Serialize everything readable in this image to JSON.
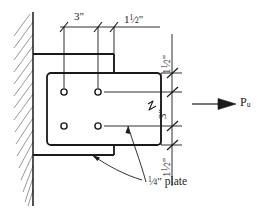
{
  "diagram": {
    "type": "structural-detail",
    "stroke_color": "#1a1a1a",
    "background": "#ffffff",
    "width": 264,
    "height": 212
  },
  "dimensions": {
    "top": [
      {
        "id": "top-dim-1",
        "value": "3\"",
        "whole": "3",
        "unit": "\"",
        "orientation": "horizontal"
      },
      {
        "id": "top-dim-2",
        "value": "1½\"",
        "whole": "1",
        "num": "1",
        "den": "2",
        "unit": "\"",
        "orientation": "horizontal"
      }
    ],
    "right": [
      {
        "id": "right-dim-1",
        "value": "1½\"",
        "whole": "1",
        "num": "1",
        "den": "2",
        "unit": "\"",
        "orientation": "vertical"
      },
      {
        "id": "right-dim-2",
        "value": "3\"",
        "whole": "3",
        "unit": "\"",
        "orientation": "vertical"
      },
      {
        "id": "right-dim-3",
        "value": "1½\"",
        "whole": "1",
        "num": "1",
        "den": "2",
        "unit": "\"",
        "orientation": "vertical"
      }
    ]
  },
  "annotations": {
    "plate_label": {
      "num": "1",
      "den": "4",
      "unit": "\"",
      "text": " plate",
      "full": "¼\" plate"
    },
    "load_label": {
      "symbol": "P",
      "subscript": "u",
      "full": "Pu"
    }
  },
  "bolts": {
    "count": 4,
    "rows": 2,
    "columns": 2,
    "positions": [
      {
        "x": 64,
        "y": 92
      },
      {
        "x": 98,
        "y": 92
      },
      {
        "x": 64,
        "y": 126
      },
      {
        "x": 98,
        "y": 126
      }
    ]
  },
  "geometry": {
    "wall_hatch": "diagonal",
    "plate_corners": "rounded",
    "break_symbol": "zigzag",
    "load_arrow": "right"
  }
}
